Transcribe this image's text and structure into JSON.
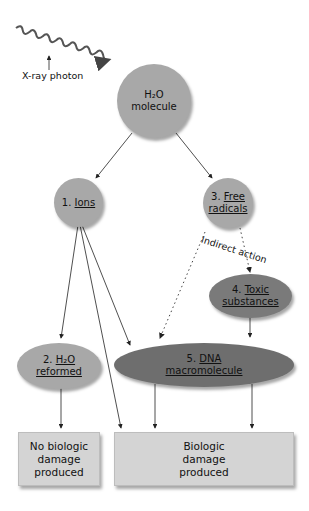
{
  "photon_label": "X-ray photon",
  "nodes": {
    "water": {
      "line1": "H₂O",
      "line2": "molecule"
    },
    "ions": {
      "num": "1. ",
      "label": "Ions"
    },
    "h2o_reformed": {
      "num": "2. ",
      "line1": "H₂O",
      "line2": "reformed"
    },
    "free_radicals": {
      "num": "3. ",
      "line1": "Free",
      "line2": "radicals"
    },
    "toxic": {
      "num": "4. ",
      "line1": "Toxic",
      "line2": "substances"
    },
    "dna": {
      "num": "5. ",
      "line1": "DNA",
      "line2": "macromolecule"
    },
    "no_damage": {
      "line1": "No biologic",
      "line2": "damage",
      "line3": "produced"
    },
    "damage": {
      "line1": "Biologic",
      "line2": "damage",
      "line3": "produced"
    }
  },
  "indirect_label": "Indirect action",
  "colors": {
    "light_gray": "#a8a8a8",
    "dark_gray": "#6e6e6e",
    "box": "#d4d4d4"
  }
}
